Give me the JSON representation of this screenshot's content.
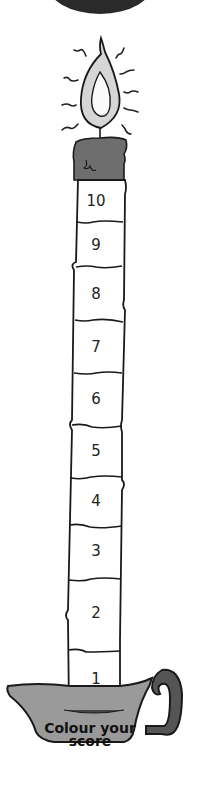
{
  "candle": {
    "segments": [
      {
        "label": "10",
        "top": 180,
        "bottom": 222
      },
      {
        "label": "9",
        "top": 222,
        "bottom": 267
      },
      {
        "label": "8",
        "top": 267,
        "bottom": 320
      },
      {
        "label": "7",
        "top": 320,
        "bottom": 373
      },
      {
        "label": "6",
        "top": 373,
        "bottom": 425
      },
      {
        "label": "5",
        "top": 425,
        "bottom": 478
      },
      {
        "label": "4",
        "top": 478,
        "bottom": 525
      },
      {
        "label": "3",
        "top": 525,
        "bottom": 580
      },
      {
        "label": "2",
        "top": 580,
        "bottom": 650
      },
      {
        "label": "1",
        "top": 650,
        "bottom": 712
      }
    ]
  },
  "holder": {
    "caption_line1": "Colour your",
    "caption_line2": "score"
  },
  "colors": {
    "outline": "#1a1a1a",
    "wax_top": "#6e6e6e",
    "holder": "#9a9a9a",
    "handle": "#555555",
    "top_disc": "#2a2a2a",
    "flame": "#d9d9d9"
  }
}
